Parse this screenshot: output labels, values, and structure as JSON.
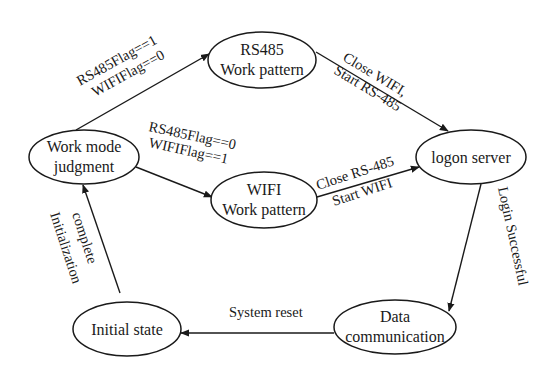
{
  "diagram": {
    "type": "state-transition",
    "nodes": [
      {
        "id": "judgment",
        "lines": [
          "Work mode",
          "judgment"
        ],
        "cx": 84,
        "cy": 157,
        "rx": 55,
        "ry": 27
      },
      {
        "id": "rs485",
        "lines": [
          "RS485",
          "Work pattern"
        ],
        "cx": 262,
        "cy": 60,
        "rx": 54,
        "ry": 28
      },
      {
        "id": "wifi",
        "lines": [
          "WIFI",
          "Work pattern"
        ],
        "cx": 264,
        "cy": 200,
        "rx": 53,
        "ry": 28
      },
      {
        "id": "logon",
        "lines": [
          "logon server"
        ],
        "cx": 471,
        "cy": 157,
        "rx": 55,
        "ry": 27
      },
      {
        "id": "data",
        "lines": [
          "Data",
          "communication"
        ],
        "cx": 395,
        "cy": 327,
        "rx": 61,
        "ry": 27
      },
      {
        "id": "initial",
        "lines": [
          "Initial state"
        ],
        "cx": 127,
        "cy": 329,
        "rx": 54,
        "ry": 27
      }
    ],
    "edges": [
      {
        "from": "judgment",
        "to": "rs485",
        "labels": [
          "RS485Flag==1",
          "WIFIFlag==0"
        ]
      },
      {
        "from": "judgment",
        "to": "wifi",
        "labels": [
          "RS485Flag==0",
          "WIFIFlag==1"
        ]
      },
      {
        "from": "rs485",
        "to": "logon",
        "labels": [
          "Close WIFI,",
          "Start  RS-485"
        ]
      },
      {
        "from": "wifi",
        "to": "logon",
        "labels": [
          "Close RS-485",
          "Start WIFI"
        ]
      },
      {
        "from": "logon",
        "to": "data",
        "labels": [
          "Login Successful"
        ]
      },
      {
        "from": "data",
        "to": "initial",
        "labels": [
          "System reset"
        ]
      },
      {
        "from": "initial",
        "to": "judgment",
        "labels": [
          "Initialization",
          "complete"
        ]
      }
    ]
  }
}
